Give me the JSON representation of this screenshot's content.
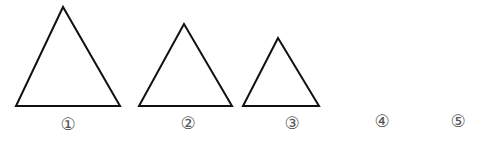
{
  "figures": [
    {
      "id": 1,
      "label": "①",
      "apex": [
        63,
        7
      ],
      "base_left": [
        16,
        106
      ],
      "base_right": [
        120,
        106
      ],
      "label_pos": [
        68,
        124
      ]
    },
    {
      "id": 2,
      "label": "②",
      "apex": [
        184,
        24
      ],
      "base_left": [
        139,
        106
      ],
      "base_right": [
        232,
        106
      ],
      "label_pos": [
        188,
        123
      ]
    },
    {
      "id": 3,
      "label": "③",
      "apex": [
        278,
        38
      ],
      "base_left": [
        243,
        106
      ],
      "base_right": [
        319,
        106
      ],
      "label_pos": [
        292,
        123
      ]
    },
    {
      "id": 4,
      "label": "④",
      "label_pos": [
        382,
        121
      ]
    },
    {
      "id": 5,
      "label": "⑤",
      "label_pos": [
        458,
        121
      ]
    }
  ],
  "colors": {
    "stroke": "#111111",
    "label": "#555555",
    "background": "#ffffff"
  }
}
